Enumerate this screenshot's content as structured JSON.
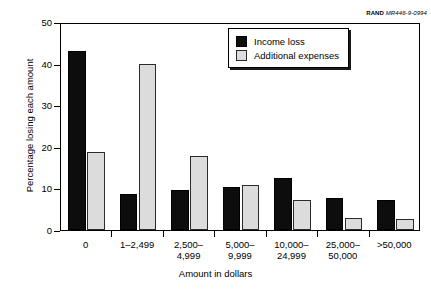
{
  "credit": {
    "mark": "RAND",
    "id": "MR446-9-0994"
  },
  "chart_data": {
    "type": "bar",
    "title": "",
    "xlabel": "Amount in dollars",
    "ylabel": "Percentage losing each amount",
    "categories": [
      "0",
      "1–2,499",
      "2,500–\n4,999",
      "5,000–\n9,999",
      "10,000–\n24,999",
      "25,000–\n50,000",
      ">50,000"
    ],
    "series": [
      {
        "name": "Income loss",
        "color": "#0d0d0d",
        "values": [
          43.0,
          8.6,
          9.5,
          10.4,
          12.6,
          7.7,
          7.1
        ]
      },
      {
        "name": "Additional expenses",
        "color": "#dcdcdc",
        "values": [
          18.7,
          39.9,
          17.7,
          10.8,
          7.2,
          3.0,
          2.7
        ]
      }
    ],
    "ylim": [
      0,
      50
    ],
    "yticks": [
      0,
      10,
      20,
      30,
      40,
      50
    ],
    "ytick_labels": [
      "0",
      "10",
      "20",
      "30",
      "40",
      "50"
    ],
    "grid": false,
    "legend_position": "top-right"
  }
}
